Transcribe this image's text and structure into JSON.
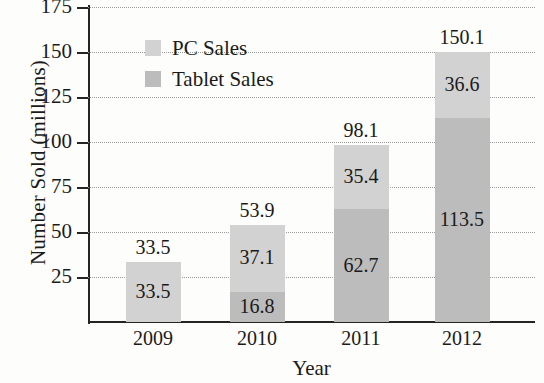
{
  "chart_data": {
    "type": "bar",
    "subtype": "stacked",
    "title": "",
    "xlabel": "Year",
    "ylabel": "Number Sold (millions)",
    "categories": [
      "2009",
      "2010",
      "2011",
      "2012"
    ],
    "ylim": [
      0,
      175
    ],
    "yticks": [
      25,
      50,
      75,
      100,
      125,
      150,
      175
    ],
    "ytick_labels": [
      "25",
      "50",
      "75",
      "100",
      "125",
      "150",
      "175"
    ],
    "grid": true,
    "legend_position": "top-left-inside",
    "series": [
      {
        "name": "PC Sales",
        "color": "#d2d2d2",
        "values": [
          33.5,
          37.1,
          35.4,
          36.6
        ],
        "value_labels": [
          "33.5",
          "37.1",
          "35.4",
          "36.6"
        ]
      },
      {
        "name": "Tablet Sales",
        "color": "#bcbcbc",
        "values": [
          0,
          16.8,
          62.7,
          113.5
        ],
        "value_labels": [
          "",
          "16.8",
          "62.7",
          "113.5"
        ]
      }
    ],
    "totals": [
      33.5,
      53.9,
      98.1,
      150.1
    ],
    "total_labels": [
      "33.5",
      "53.9",
      "98.1",
      "150.1"
    ]
  },
  "legend": {
    "items": [
      {
        "label": "PC Sales",
        "color": "#d2d2d2"
      },
      {
        "label": "Tablet Sales",
        "color": "#bcbcbc"
      }
    ]
  },
  "axes": {
    "y_title": "Number Sold (millions)",
    "x_title": "Year"
  },
  "colors": {
    "pc_sales": "#d2d2d2",
    "tablet_sales": "#bcbcbc",
    "axis": "#242424",
    "grid": "#9a9a9a",
    "background": "#fdfdfb",
    "text": "#1a1a1a"
  }
}
